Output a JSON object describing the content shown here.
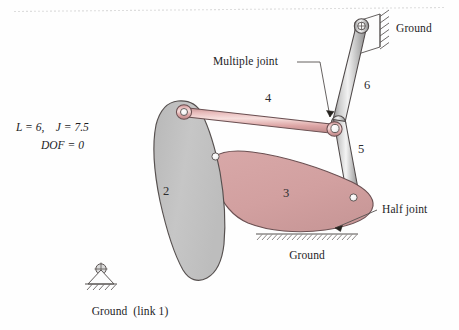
{
  "figure": {
    "type": "kinematic-linkage-diagram",
    "background_color": "#fefefe"
  },
  "equations": {
    "line1": "L = 6,    J = 7.5",
    "line2": "DOF = 0",
    "L": "6",
    "J": "7.5",
    "DOF": "0"
  },
  "annotations": {
    "multiple_joint": "Multiple joint",
    "half_joint": "Half joint",
    "ground_top_right": "Ground",
    "ground_bottom_center": "Ground",
    "ground_bottom_left": "Ground  (link 1)"
  },
  "link_numbers": {
    "link2": "2",
    "link3": "3",
    "link4": "4",
    "link5": "5",
    "link6": "6"
  },
  "colors": {
    "link2_fill": "#c2c2c2",
    "link3_fill": "#d3a1a1",
    "link4_fill": "#e0aeae",
    "bar_metal_light": "#e8e8e8",
    "bar_metal_dark": "#9a9a9a",
    "outline": "#4a4446",
    "text": "#1d1d1f",
    "joint_white": "#ffffff"
  },
  "icons": {
    "ground_support_top": "hatched-wall-icon",
    "ground_support_bottom_left": "hatched-triangle-pivot-icon",
    "ground_line_bottom": "hatched-ground-line-icon",
    "pivot_joint": "pivot-cross-circle-icon",
    "leader_arrow": "arrowhead-icon"
  }
}
